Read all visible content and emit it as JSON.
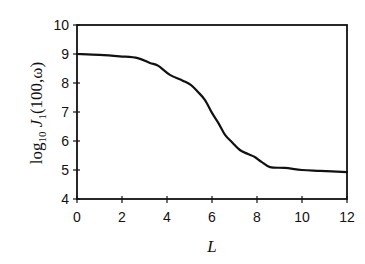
{
  "chart_data": {
    "type": "line",
    "title": "",
    "xlabel": "L",
    "ylabel": "log10 J1(100,ω)",
    "ylabel_parts": {
      "prefix": "log",
      "prefix_sub": "10",
      "func": " J",
      "func_sub": "1",
      "args": "(100,ω)"
    },
    "xlim": [
      0,
      12
    ],
    "ylim": [
      4,
      10
    ],
    "xticks": [
      0,
      2,
      4,
      6,
      8,
      10,
      12
    ],
    "yticks": [
      4,
      5,
      6,
      7,
      8,
      9,
      10
    ],
    "grid": false,
    "legend": null,
    "series": [
      {
        "name": "log10 J1(100,ω)",
        "color": "#111111",
        "x": [
          0,
          1.0,
          1.9,
          2.7,
          3.24,
          3.6,
          4.13,
          4.7,
          5.07,
          5.38,
          5.69,
          6.0,
          6.3,
          6.58,
          6.9,
          7.24,
          7.6,
          7.9,
          8.2,
          8.58,
          9.24,
          10.0,
          10.8,
          12.0
        ],
        "y": [
          9.0,
          8.97,
          8.92,
          8.86,
          8.69,
          8.6,
          8.28,
          8.08,
          7.93,
          7.69,
          7.41,
          6.97,
          6.6,
          6.21,
          5.95,
          5.69,
          5.55,
          5.45,
          5.28,
          5.1,
          5.07,
          5.0,
          4.97,
          4.93
        ]
      }
    ]
  }
}
